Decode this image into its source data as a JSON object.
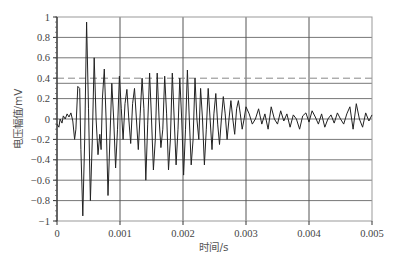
{
  "chart_data": {
    "type": "line",
    "title": "",
    "xlabel": "时间/s",
    "ylabel": "电压幅值/mV",
    "xlim": [
      0,
      0.005
    ],
    "ylim": [
      -1,
      1
    ],
    "grid": true,
    "legend": null,
    "x_ticks": [
      "0",
      "0.001",
      "0.002",
      "0.003",
      "0.004",
      "0.005"
    ],
    "y_ticks": [
      "1",
      "0.8",
      "0.6",
      "0.4",
      "0.2",
      "0",
      "-0.2",
      "-0.4",
      "-0.6",
      "-0.8",
      "-1"
    ],
    "x_tick_values": [
      0,
      0.001,
      0.002,
      0.003,
      0.004,
      0.005
    ],
    "y_tick_values": [
      1,
      0.8,
      0.6,
      0.4,
      0.2,
      0,
      -0.2,
      -0.4,
      -0.6,
      -0.8,
      -1
    ],
    "horizontal_gridlines": [
      0.8,
      0.6,
      0.35,
      0.2,
      0,
      -0.2,
      -0.4,
      -0.6,
      -0.8
    ],
    "threshold_line": {
      "value": 0.4,
      "style": "dashed"
    },
    "series": [
      {
        "name": "电压信号",
        "x": [
          0,
          3e-05,
          5e-05,
          8e-05,
          0.0001,
          0.00013,
          0.00016,
          0.00019,
          0.00022,
          0.00025,
          0.00028,
          0.0003,
          0.00033,
          0.00036,
          0.00038,
          0.00041,
          0.00044,
          0.00047,
          0.0005,
          0.00053,
          0.00056,
          0.00059,
          0.00062,
          0.00065,
          0.00068,
          0.0007,
          0.00072,
          0.00075,
          0.00078,
          0.00081,
          0.00084,
          0.00087,
          0.0009,
          0.00093,
          0.00096,
          0.00099,
          0.00102,
          0.00105,
          0.00108,
          0.00111,
          0.00114,
          0.00117,
          0.0012,
          0.00123,
          0.00126,
          0.00129,
          0.00132,
          0.00135,
          0.00138,
          0.00141,
          0.00144,
          0.00147,
          0.0015,
          0.00153,
          0.00156,
          0.00159,
          0.00162,
          0.00165,
          0.00168,
          0.00171,
          0.00174,
          0.00177,
          0.0018,
          0.00183,
          0.00186,
          0.00189,
          0.00192,
          0.00195,
          0.00198,
          0.00201,
          0.00204,
          0.00207,
          0.0021,
          0.00213,
          0.00216,
          0.00219,
          0.00222,
          0.00225,
          0.00228,
          0.00231,
          0.00234,
          0.00237,
          0.0024,
          0.00243,
          0.00246,
          0.00249,
          0.00252,
          0.00255,
          0.00258,
          0.00261,
          0.00264,
          0.00267,
          0.0027,
          0.00273,
          0.00276,
          0.00279,
          0.00282,
          0.00285,
          0.00288,
          0.00291,
          0.00294,
          0.00297,
          0.003,
          0.00305,
          0.0031,
          0.00315,
          0.0032,
          0.00325,
          0.0033,
          0.00335,
          0.0034,
          0.00345,
          0.0035,
          0.00355,
          0.0036,
          0.00365,
          0.0037,
          0.00375,
          0.0038,
          0.00385,
          0.0039,
          0.00395,
          0.004,
          0.00405,
          0.0041,
          0.00415,
          0.0042,
          0.00425,
          0.0043,
          0.00435,
          0.0044,
          0.00445,
          0.0045,
          0.00455,
          0.0046,
          0.00465,
          0.0047,
          0.00475,
          0.0048,
          0.00485,
          0.0049,
          0.00495,
          0.005
        ],
        "y": [
          -0.05,
          -0.08,
          0.0,
          -0.04,
          0.03,
          0.0,
          0.05,
          0.02,
          0.06,
          -0.02,
          -0.2,
          -0.1,
          0.32,
          0.3,
          -0.3,
          -0.95,
          -0.2,
          0.95,
          0.1,
          -0.8,
          -0.2,
          0.6,
          0.0,
          -0.35,
          -0.15,
          -0.3,
          0.2,
          0.49,
          0.0,
          -0.75,
          -0.2,
          0.35,
          0.0,
          -0.48,
          -0.1,
          0.42,
          0.1,
          -0.2,
          0.15,
          0.29,
          0.0,
          -0.24,
          0.15,
          0.3,
          0.0,
          -0.3,
          0.05,
          0.4,
          0.1,
          -0.6,
          -0.05,
          0.45,
          0.0,
          -0.5,
          -0.2,
          0.45,
          0.0,
          -0.28,
          -0.1,
          0.42,
          0.05,
          -0.5,
          -0.2,
          0.45,
          0.0,
          -0.45,
          -0.1,
          0.4,
          0.0,
          -0.55,
          -0.1,
          0.48,
          0.0,
          -0.45,
          -0.2,
          0.4,
          0.0,
          -0.2,
          0.3,
          0.0,
          -0.45,
          -0.1,
          0.3,
          0.0,
          -0.3,
          0.05,
          0.25,
          -0.05,
          -0.25,
          0.0,
          0.22,
          0.05,
          -0.2,
          0.0,
          0.18,
          0.0,
          -0.15,
          0.1,
          0.18,
          0.05,
          -0.1,
          0.0,
          0.12,
          0.05,
          -0.05,
          0.0,
          0.1,
          -0.05,
          0.05,
          -0.1,
          0.12,
          0.0,
          -0.05,
          0.08,
          -0.02,
          0.05,
          -0.08,
          0.04,
          0.0,
          -0.1,
          0.03,
          0.06,
          -0.03,
          0.08,
          0.02,
          -0.05,
          0.05,
          -0.08,
          0.0,
          0.04,
          -0.04,
          0.06,
          0.0,
          -0.05,
          0.05,
          0.12,
          -0.1,
          0.15,
          0.0,
          -0.08,
          0.06,
          -0.02,
          0.04
        ]
      }
    ]
  }
}
